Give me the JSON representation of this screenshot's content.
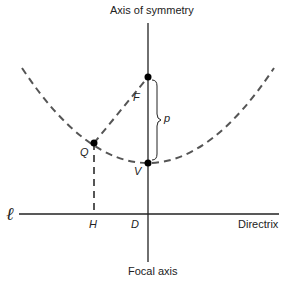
{
  "labels": {
    "axis_of_symmetry": "Axis of symmetry",
    "focal_axis": "Focal axis",
    "directrix": "Directrix",
    "ell": "ℓ",
    "F": "F",
    "V": "V",
    "Q": "Q",
    "H": "H",
    "D": "D",
    "p": "p"
  },
  "colors": {
    "line": "#222222",
    "dashed": "#555555"
  }
}
